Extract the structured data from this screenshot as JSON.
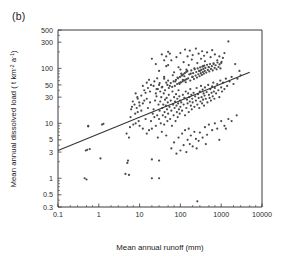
{
  "figure": {
    "panel_label": "(b)",
    "background_color": "#ffffff",
    "frame_color": "#3a3a3a"
  },
  "chart_data": {
    "type": "scatter",
    "title": "",
    "panel": "(b)",
    "xlabel": "Mean annual runoff (mm)",
    "ylabel": "Mean annual dissolved load ( t km-2 a-1)",
    "ylabel_parts": {
      "prefix": "Mean annual dissolved load ( t km",
      "sup1": "-2",
      "mid": " a",
      "sup2": "-1",
      "suffix": ")"
    },
    "xscale": "log",
    "yscale": "log",
    "xlim": [
      0.1,
      10000
    ],
    "ylim": [
      0.3,
      500
    ],
    "grid": false,
    "legend": false,
    "xticks": [
      0.1,
      1,
      10,
      100,
      1000,
      10000
    ],
    "xticklabels": [
      "0.1",
      "1",
      "10",
      "100",
      "1000",
      "10000"
    ],
    "yticks": [
      0.3,
      0.5,
      1,
      3,
      5,
      10,
      30,
      50,
      100,
      300,
      500
    ],
    "yticklabels": [
      "0.3",
      "0.5",
      "1",
      "3",
      "5",
      "10",
      "30",
      "50",
      "100",
      "300",
      "500"
    ],
    "marker": "dot",
    "marker_color": "#4a4a4a",
    "marker_size": 1.1,
    "regression_line": {
      "x_start": 0.1,
      "y_start": 3.2,
      "x_end": 5000,
      "y_end": 85,
      "color": "#333333"
    },
    "points": [
      [
        0.45,
        1.0
      ],
      [
        0.5,
        0.95
      ],
      [
        0.52,
        3.3
      ],
      [
        0.55,
        9.0
      ],
      [
        0.6,
        3.4
      ],
      [
        1.1,
        2.3
      ],
      [
        1.3,
        9.8
      ],
      [
        4.5,
        1.2
      ],
      [
        5.0,
        1.9
      ],
      [
        5.2,
        2.1
      ],
      [
        5.5,
        1.15
      ],
      [
        5.8,
        8.5
      ],
      [
        6.2,
        18
      ],
      [
        6.5,
        20
      ],
      [
        7.0,
        9.5
      ],
      [
        7.5,
        22
      ],
      [
        8.0,
        10
      ],
      [
        8.5,
        19
      ],
      [
        9.0,
        16
      ],
      [
        9.5,
        11
      ],
      [
        10,
        9.0
      ],
      [
        10,
        21
      ],
      [
        11,
        17
      ],
      [
        12,
        8.0
      ],
      [
        12,
        23
      ],
      [
        13,
        40
      ],
      [
        14,
        12
      ],
      [
        15,
        6.5
      ],
      [
        15,
        28
      ],
      [
        16,
        19
      ],
      [
        17,
        7.5
      ],
      [
        18,
        24
      ],
      [
        19,
        11
      ],
      [
        20,
        8.0
      ],
      [
        20,
        1.0
      ],
      [
        21,
        15
      ],
      [
        22,
        18
      ],
      [
        23,
        13
      ],
      [
        24,
        26
      ],
      [
        25,
        9.0
      ],
      [
        26,
        31
      ],
      [
        27,
        14
      ],
      [
        28,
        5.5
      ],
      [
        29,
        22
      ],
      [
        30,
        12
      ],
      [
        30,
        2.1
      ],
      [
        31,
        17
      ],
      [
        32,
        25
      ],
      [
        33,
        10
      ],
      [
        34,
        30
      ],
      [
        35,
        7.0
      ],
      [
        36,
        19
      ],
      [
        37,
        14
      ],
      [
        38,
        22
      ],
      [
        39,
        35
      ],
      [
        40,
        9.5
      ],
      [
        41,
        16
      ],
      [
        42,
        27
      ],
      [
        43,
        13
      ],
      [
        44,
        21
      ],
      [
        45,
        6.0
      ],
      [
        46,
        29
      ],
      [
        47,
        18
      ],
      [
        48,
        11
      ],
      [
        49,
        24
      ],
      [
        50,
        15
      ],
      [
        50,
        60
      ],
      [
        52,
        33
      ],
      [
        54,
        20
      ],
      [
        56,
        12
      ],
      [
        58,
        26
      ],
      [
        60,
        17
      ],
      [
        62,
        9.0
      ],
      [
        64,
        38
      ],
      [
        66,
        22
      ],
      [
        68,
        14
      ],
      [
        70,
        30
      ],
      [
        72,
        19
      ],
      [
        74,
        25
      ],
      [
        76,
        11
      ],
      [
        78,
        34
      ],
      [
        80,
        21
      ],
      [
        82,
        16
      ],
      [
        84,
        28
      ],
      [
        86,
        13
      ],
      [
        88,
        23
      ],
      [
        90,
        40
      ],
      [
        92,
        18
      ],
      [
        94,
        31
      ],
      [
        96,
        15
      ],
      [
        98,
        26
      ],
      [
        100,
        20
      ],
      [
        100,
        55
      ],
      [
        100,
        95
      ],
      [
        105,
        24
      ],
      [
        110,
        17
      ],
      [
        115,
        33
      ],
      [
        120,
        22
      ],
      [
        125,
        29
      ],
      [
        130,
        14
      ],
      [
        135,
        38
      ],
      [
        140,
        19
      ],
      [
        145,
        27
      ],
      [
        150,
        23
      ],
      [
        155,
        35
      ],
      [
        160,
        16
      ],
      [
        165,
        30
      ],
      [
        170,
        25
      ],
      [
        175,
        42
      ],
      [
        180,
        21
      ],
      [
        185,
        33
      ],
      [
        190,
        18
      ],
      [
        195,
        28
      ],
      [
        200,
        24
      ],
      [
        200,
        70
      ],
      [
        210,
        36
      ],
      [
        220,
        20
      ],
      [
        230,
        31
      ],
      [
        240,
        26
      ],
      [
        250,
        44
      ],
      [
        260,
        22
      ],
      [
        270,
        34
      ],
      [
        280,
        29
      ],
      [
        290,
        19
      ],
      [
        300,
        38
      ],
      [
        310,
        25
      ],
      [
        320,
        48
      ],
      [
        330,
        30
      ],
      [
        340,
        23
      ],
      [
        350,
        41
      ],
      [
        360,
        27
      ],
      [
        370,
        35
      ],
      [
        380,
        21
      ],
      [
        390,
        32
      ],
      [
        400,
        45
      ],
      [
        420,
        28
      ],
      [
        440,
        37
      ],
      [
        460,
        24
      ],
      [
        480,
        50
      ],
      [
        500,
        33
      ],
      [
        520,
        29
      ],
      [
        540,
        42
      ],
      [
        560,
        26
      ],
      [
        580,
        36
      ],
      [
        600,
        47
      ],
      [
        620,
        31
      ],
      [
        640,
        55
      ],
      [
        660,
        38
      ],
      [
        680,
        28
      ],
      [
        700,
        44
      ],
      [
        750,
        35
      ],
      [
        800,
        52
      ],
      [
        850,
        40
      ],
      [
        900,
        30
      ],
      [
        950,
        60
      ],
      [
        1000,
        45
      ],
      [
        1050,
        38
      ],
      [
        1100,
        55
      ],
      [
        1200,
        42
      ],
      [
        1300,
        65
      ],
      [
        1400,
        48
      ],
      [
        1500,
        310
      ],
      [
        1600,
        58
      ],
      [
        1800,
        70
      ],
      [
        2000,
        52
      ],
      [
        2200,
        120
      ],
      [
        2500,
        65
      ],
      [
        2800,
        90
      ],
      [
        3000,
        75
      ],
      [
        20,
        150
      ],
      [
        25,
        120
      ],
      [
        30,
        90
      ],
      [
        35,
        180
      ],
      [
        40,
        70
      ],
      [
        45,
        110
      ],
      [
        50,
        200
      ],
      [
        60,
        140
      ],
      [
        70,
        85
      ],
      [
        80,
        160
      ],
      [
        90,
        105
      ],
      [
        100,
        190
      ],
      [
        110,
        75
      ],
      [
        120,
        130
      ],
      [
        130,
        220
      ],
      [
        140,
        95
      ],
      [
        150,
        165
      ],
      [
        160,
        115
      ],
      [
        170,
        210
      ],
      [
        180,
        80
      ],
      [
        190,
        145
      ],
      [
        200,
        175
      ],
      [
        220,
        100
      ],
      [
        240,
        230
      ],
      [
        260,
        125
      ],
      [
        280,
        185
      ],
      [
        300,
        90
      ],
      [
        320,
        150
      ],
      [
        340,
        205
      ],
      [
        360,
        110
      ],
      [
        380,
        170
      ],
      [
        400,
        135
      ],
      [
        450,
        195
      ],
      [
        500,
        105
      ],
      [
        550,
        160
      ],
      [
        600,
        215
      ],
      [
        650,
        120
      ],
      [
        700,
        180
      ],
      [
        800,
        140
      ],
      [
        900,
        165
      ],
      [
        1000,
        125
      ],
      [
        1100,
        155
      ],
      [
        1200,
        190
      ],
      [
        60,
        3.5
      ],
      [
        70,
        4.5
      ],
      [
        80,
        2.8
      ],
      [
        90,
        5.5
      ],
      [
        100,
        3.2
      ],
      [
        110,
        6.5
      ],
      [
        120,
        4.0
      ],
      [
        130,
        7.5
      ],
      [
        140,
        3.0
      ],
      [
        150,
        5.0
      ],
      [
        160,
        8.0
      ],
      [
        170,
        4.2
      ],
      [
        180,
        6.0
      ],
      [
        200,
        3.8
      ],
      [
        220,
        7.0
      ],
      [
        240,
        5.2
      ],
      [
        260,
        0.38
      ],
      [
        280,
        4.8
      ],
      [
        300,
        6.8
      ],
      [
        350,
        5.5
      ],
      [
        400,
        8.5
      ],
      [
        450,
        6.2
      ],
      [
        500,
        9.5
      ],
      [
        600,
        7.5
      ],
      [
        700,
        10
      ],
      [
        800,
        8.0
      ],
      [
        1000,
        11
      ],
      [
        1200,
        9.0
      ],
      [
        1500,
        12
      ],
      [
        30,
        50
      ],
      [
        35,
        45
      ],
      [
        40,
        65
      ],
      [
        45,
        55
      ],
      [
        55,
        48
      ],
      [
        65,
        75
      ],
      [
        75,
        58
      ],
      [
        85,
        68
      ],
      [
        95,
        52
      ],
      [
        105,
        80
      ],
      [
        115,
        62
      ],
      [
        125,
        72
      ],
      [
        135,
        56
      ],
      [
        145,
        88
      ],
      [
        155,
        66
      ],
      [
        165,
        78
      ],
      [
        175,
        60
      ],
      [
        185,
        92
      ],
      [
        195,
        70
      ],
      [
        205,
        82
      ],
      [
        215,
        64
      ],
      [
        225,
        96
      ],
      [
        235,
        74
      ],
      [
        245,
        86
      ],
      [
        255,
        68
      ],
      [
        265,
        100
      ],
      [
        275,
        78
      ],
      [
        285,
        90
      ],
      [
        295,
        72
      ],
      [
        305,
        104
      ],
      [
        315,
        82
      ],
      [
        325,
        94
      ],
      [
        335,
        76
      ],
      [
        345,
        108
      ],
      [
        355,
        86
      ],
      [
        365,
        98
      ],
      [
        375,
        80
      ],
      [
        385,
        112
      ],
      [
        395,
        90
      ],
      [
        410,
        102
      ],
      [
        430,
        84
      ],
      [
        450,
        116
      ],
      [
        470,
        94
      ],
      [
        490,
        106
      ],
      [
        510,
        88
      ],
      [
        530,
        120
      ],
      [
        560,
        98
      ],
      [
        590,
        110
      ],
      [
        620,
        92
      ],
      [
        650,
        124
      ],
      [
        690,
        102
      ],
      [
        730,
        114
      ],
      [
        770,
        96
      ],
      [
        810,
        128
      ],
      [
        860,
        106
      ],
      [
        910,
        118
      ],
      [
        960,
        100
      ],
      [
        1020,
        132
      ],
      [
        25,
        35
      ],
      [
        28,
        42
      ],
      [
        32,
        38
      ],
      [
        36,
        46
      ],
      [
        42,
        40
      ],
      [
        48,
        50
      ],
      [
        52,
        44
      ],
      [
        58,
        54
      ],
      [
        63,
        46
      ],
      [
        68,
        58
      ],
      [
        73,
        48
      ],
      [
        78,
        62
      ],
      [
        83,
        52
      ],
      [
        88,
        66
      ],
      [
        93,
        54
      ],
      [
        98,
        70
      ],
      [
        103,
        56
      ],
      [
        108,
        74
      ],
      [
        113,
        58
      ],
      [
        118,
        78
      ],
      [
        123,
        60
      ],
      [
        128,
        82
      ],
      [
        133,
        62
      ],
      [
        138,
        86
      ],
      [
        143,
        64
      ],
      [
        148,
        90
      ],
      [
        8,
        35
      ],
      [
        9,
        28
      ],
      [
        11,
        32
      ],
      [
        13,
        26
      ],
      [
        16,
        44
      ],
      [
        18,
        38
      ],
      [
        22,
        48
      ],
      [
        26,
        42
      ],
      [
        15,
        55
      ],
      [
        17,
        62
      ],
      [
        19,
        50
      ],
      [
        23,
        58
      ],
      [
        27,
        66
      ],
      [
        31,
        54
      ],
      [
        4.8,
        6.5
      ],
      [
        6.0,
        13
      ],
      [
        6.8,
        25
      ],
      [
        7.8,
        15
      ],
      [
        8.8,
        30
      ],
      [
        9.8,
        24
      ],
      [
        12,
        48
      ],
      [
        14,
        36
      ],
      [
        40,
        140
      ],
      [
        45,
        165
      ],
      [
        50,
        115
      ],
      [
        55,
        185
      ],
      [
        0.48,
        3.2
      ],
      [
        0.55,
        8.8
      ],
      [
        1.2,
        9.5
      ],
      [
        5.5,
        5.5
      ],
      [
        20,
        2.2
      ],
      [
        30,
        1.0
      ],
      [
        250,
        3.5
      ],
      [
        420,
        4.2
      ],
      [
        900,
        5.0
      ],
      [
        1300,
        8.0
      ],
      [
        1800,
        11
      ],
      [
        2400,
        14
      ]
    ]
  }
}
